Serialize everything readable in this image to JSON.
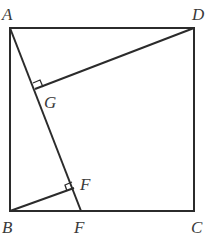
{
  "diagram": {
    "type": "geometry",
    "stroke_color": "#2b2b2b",
    "points": {
      "A": {
        "label": "A",
        "x": 10,
        "y": 28
      },
      "D": {
        "label": "D",
        "x": 194,
        "y": 28
      },
      "B": {
        "label": "B",
        "x": 10,
        "y": 211
      },
      "C": {
        "label": "C",
        "x": 194,
        "y": 211
      },
      "E": {
        "label": "F",
        "x": 81,
        "y": 211
      },
      "G": {
        "label": "G",
        "x": 35,
        "y": 89
      },
      "F": {
        "label": "F",
        "x": 74,
        "y": 188
      }
    },
    "labels": {
      "A": "A",
      "D": "D",
      "B": "B",
      "C": "C",
      "G": "G",
      "F": "F",
      "E": "F"
    },
    "right_angle_marks": [
      "G",
      "F"
    ]
  }
}
